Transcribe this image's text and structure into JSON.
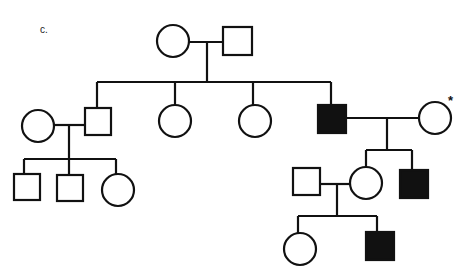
{
  "figure": {
    "panel_label": "c.",
    "marker_symbol": "*",
    "colors": {
      "line": "#111111",
      "affected_fill": "#111111",
      "unaffected_fill": "#ffffff"
    }
  },
  "legend_semantics": {
    "square": "male",
    "circle": "female",
    "filled": "affected",
    "open": "unaffected",
    "asterisk": "marked individual (proband/carrier)"
  },
  "individuals": [
    {
      "id": "I-1",
      "generation": 1,
      "sex": "female",
      "affected": false,
      "shape": "circle",
      "cx": 173,
      "cy": 41
    },
    {
      "id": "I-2",
      "generation": 1,
      "sex": "male",
      "affected": false,
      "shape": "square",
      "cx": 237,
      "cy": 41
    },
    {
      "id": "II-1",
      "generation": 2,
      "sex": "female",
      "affected": false,
      "shape": "circle",
      "cx": 38,
      "cy": 126,
      "note": "spouse"
    },
    {
      "id": "II-2",
      "generation": 2,
      "sex": "male",
      "affected": false,
      "shape": "square",
      "cx": 98,
      "cy": 122
    },
    {
      "id": "II-3",
      "generation": 2,
      "sex": "female",
      "affected": false,
      "shape": "circle",
      "cx": 175,
      "cy": 121
    },
    {
      "id": "II-4",
      "generation": 2,
      "sex": "female",
      "affected": false,
      "shape": "circle",
      "cx": 255,
      "cy": 121
    },
    {
      "id": "II-5",
      "generation": 2,
      "sex": "male",
      "affected": true,
      "shape": "square",
      "cx": 332,
      "cy": 119
    },
    {
      "id": "II-6",
      "generation": 2,
      "sex": "female",
      "affected": false,
      "shape": "circle",
      "cx": 435,
      "cy": 118,
      "marked": true,
      "note": "spouse"
    },
    {
      "id": "III-1",
      "generation": 3,
      "sex": "male",
      "affected": false,
      "shape": "square",
      "cx": 27,
      "cy": 187
    },
    {
      "id": "III-2",
      "generation": 3,
      "sex": "male",
      "affected": false,
      "shape": "square",
      "cx": 70,
      "cy": 188
    },
    {
      "id": "III-3",
      "generation": 3,
      "sex": "female",
      "affected": false,
      "shape": "circle",
      "cx": 118,
      "cy": 190
    },
    {
      "id": "III-4",
      "generation": 3,
      "sex": "male",
      "affected": false,
      "shape": "square",
      "cx": 306,
      "cy": 181,
      "note": "spouse"
    },
    {
      "id": "III-5",
      "generation": 3,
      "sex": "female",
      "affected": false,
      "shape": "circle",
      "cx": 366,
      "cy": 183
    },
    {
      "id": "III-6",
      "generation": 3,
      "sex": "male",
      "affected": true,
      "shape": "square",
      "cx": 414,
      "cy": 184
    },
    {
      "id": "IV-1",
      "generation": 4,
      "sex": "female",
      "affected": false,
      "shape": "circle",
      "cx": 300,
      "cy": 249
    },
    {
      "id": "IV-2",
      "generation": 4,
      "sex": "male",
      "affected": true,
      "shape": "square",
      "cx": 380,
      "cy": 246
    }
  ],
  "matings": [
    {
      "partners": [
        "I-1",
        "I-2"
      ],
      "children": [
        "II-2",
        "II-3",
        "II-4",
        "II-5"
      ]
    },
    {
      "partners": [
        "II-1",
        "II-2"
      ],
      "children": [
        "III-1",
        "III-2",
        "III-3"
      ]
    },
    {
      "partners": [
        "II-5",
        "II-6"
      ],
      "children": [
        "III-5",
        "III-6"
      ]
    },
    {
      "partners": [
        "III-4",
        "III-5"
      ],
      "children": [
        "IV-1",
        "IV-2"
      ]
    }
  ]
}
